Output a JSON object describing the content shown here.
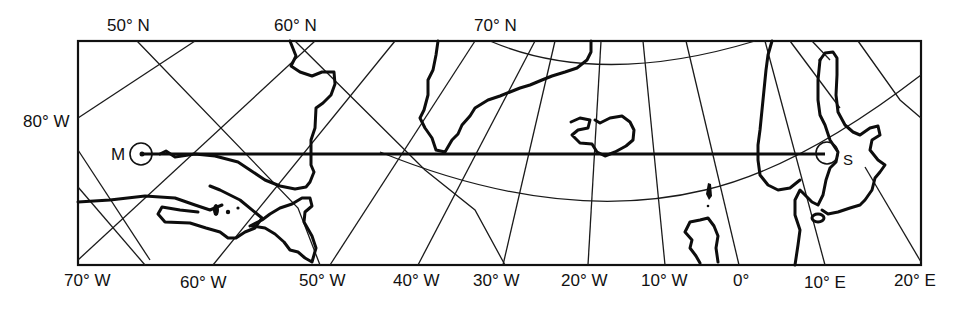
{
  "map": {
    "projection": "great-circle route map, North Atlantic",
    "top_labels": [
      "50° N",
      "60° N",
      "70° N"
    ],
    "left_labels": [
      "80° W"
    ],
    "bottom_labels": [
      "70° W",
      "60° W",
      "50° W",
      "40° W",
      "30° W",
      "20° W",
      "10° W",
      "0°",
      "10° E",
      "20° E"
    ],
    "points": {
      "start": {
        "label": "M"
      },
      "end": {
        "label": "S"
      }
    },
    "colors": {
      "ink": "#111111",
      "background": "#ffffff"
    }
  }
}
